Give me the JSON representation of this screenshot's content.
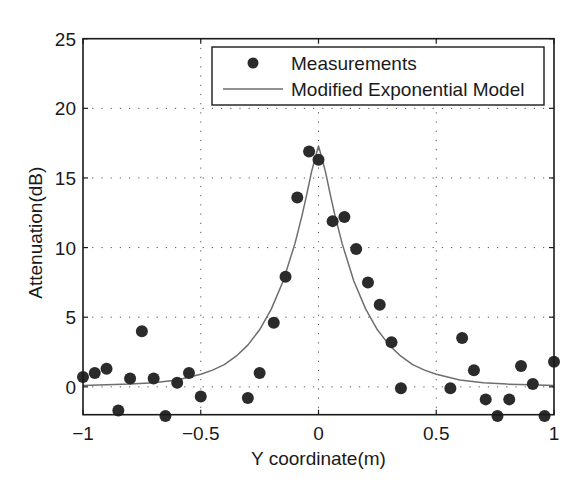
{
  "chart_data": {
    "type": "scatter",
    "title": "",
    "xlabel": "Y coordinate(m)",
    "ylabel": "Attenuation(dB)",
    "xlim": [
      -1,
      1
    ],
    "ylim": [
      -2,
      25
    ],
    "xticks": [
      -1,
      -0.5,
      0,
      0.5,
      1
    ],
    "xtick_labels": [
      "−1",
      "−0.5",
      "0",
      "0.5",
      "1"
    ],
    "yticks": [
      0,
      5,
      10,
      15,
      20,
      25
    ],
    "ytick_labels": [
      "0",
      "5",
      "10",
      "15",
      "20",
      "25"
    ],
    "grid": true,
    "legend_position": "upper right",
    "series": [
      {
        "name": "Measurements",
        "type": "scatter",
        "marker": "filled-circle",
        "color": "#2b2b2b",
        "x": [
          -1.0,
          -0.95,
          -0.9,
          -0.85,
          -0.8,
          -0.75,
          -0.7,
          -0.65,
          -0.6,
          -0.55,
          -0.5,
          -0.3,
          -0.25,
          -0.19,
          -0.14,
          -0.09,
          -0.04,
          0.0,
          0.06,
          0.11,
          0.16,
          0.21,
          0.26,
          0.31,
          0.35,
          0.56,
          0.61,
          0.66,
          0.71,
          0.76,
          0.81,
          0.86,
          0.91,
          0.96,
          1.0
        ],
        "y": [
          0.7,
          1.0,
          1.3,
          -1.7,
          0.6,
          4.0,
          0.6,
          -2.1,
          0.3,
          1.0,
          -0.7,
          -0.8,
          1.0,
          4.6,
          7.9,
          13.6,
          16.9,
          16.3,
          11.9,
          12.2,
          9.9,
          7.5,
          5.9,
          3.2,
          -0.1,
          -0.1,
          3.5,
          1.2,
          -0.9,
          -2.1,
          -0.9,
          1.5,
          0.2,
          -2.1,
          1.8
        ]
      },
      {
        "name": "Modified Exponential Model",
        "type": "line",
        "color": "#6e6e6e",
        "x": [
          -1.0,
          -0.9,
          -0.8,
          -0.7,
          -0.6,
          -0.5,
          -0.45,
          -0.4,
          -0.35,
          -0.3,
          -0.25,
          -0.2,
          -0.15,
          -0.1,
          -0.07,
          -0.05,
          -0.03,
          -0.015,
          0.0,
          0.015,
          0.03,
          0.05,
          0.07,
          0.1,
          0.15,
          0.2,
          0.25,
          0.3,
          0.35,
          0.4,
          0.45,
          0.5,
          0.6,
          0.7,
          0.8,
          0.9,
          1.0
        ],
        "y": [
          0.1,
          0.15,
          0.2,
          0.3,
          0.5,
          0.9,
          1.2,
          1.6,
          2.2,
          3.0,
          4.1,
          5.6,
          7.6,
          10.3,
          12.3,
          13.8,
          15.4,
          16.4,
          17.3,
          16.4,
          15.4,
          13.8,
          12.3,
          10.3,
          7.6,
          5.6,
          4.1,
          3.0,
          2.2,
          1.6,
          1.2,
          0.9,
          0.5,
          0.3,
          0.2,
          0.15,
          0.1
        ]
      }
    ]
  },
  "legend": {
    "items": [
      {
        "label": "Measurements",
        "symbol": "filled-circle-icon"
      },
      {
        "label": "Modified Exponential Model",
        "symbol": "line-icon"
      }
    ]
  },
  "colors": {
    "marker": "#2b2b2b",
    "model_line": "#6e6e6e",
    "axes": "#1a1a1a",
    "grid": "#555555"
  }
}
